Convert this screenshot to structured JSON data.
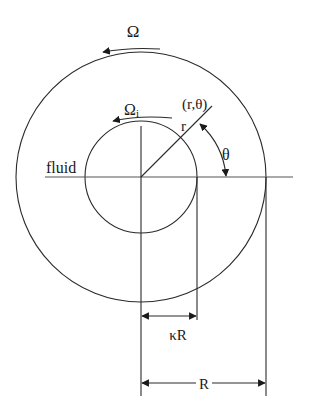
{
  "diagram": {
    "type": "concentric-cylinders-couette-flow",
    "labels": {
      "outer_rotation": "Ω",
      "inner_rotation": "Ω",
      "inner_rotation_sub": "i",
      "point": "(r,θ)",
      "radius": "r",
      "angle": "θ",
      "medium": "fluid",
      "inner_radius_dim": "κR",
      "outer_radius_dim": "R"
    },
    "geometry": {
      "center": [
        141,
        177
      ],
      "outer_radius": 125,
      "inner_radius": 56
    },
    "colors": {
      "stroke": "#2a2a2a",
      "text": "#1a1a1a",
      "background": "#ffffff"
    }
  }
}
